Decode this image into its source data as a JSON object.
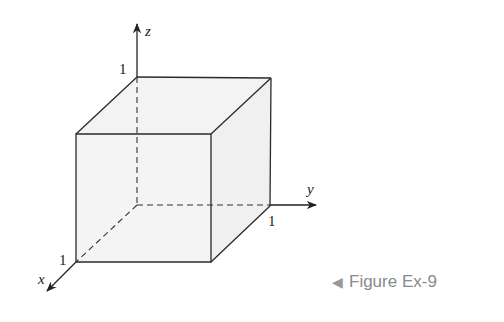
{
  "diagram": {
    "type": "unit-cube",
    "axes": {
      "x": "x",
      "y": "y",
      "z": "z"
    },
    "ticks": {
      "x": "1",
      "y": "1",
      "z": "1"
    },
    "colors": {
      "face_fill": "#f2f2f2",
      "stroke": "#2a2a2a"
    }
  },
  "caption": {
    "arrow": "◀",
    "text": "Figure Ex-9"
  }
}
